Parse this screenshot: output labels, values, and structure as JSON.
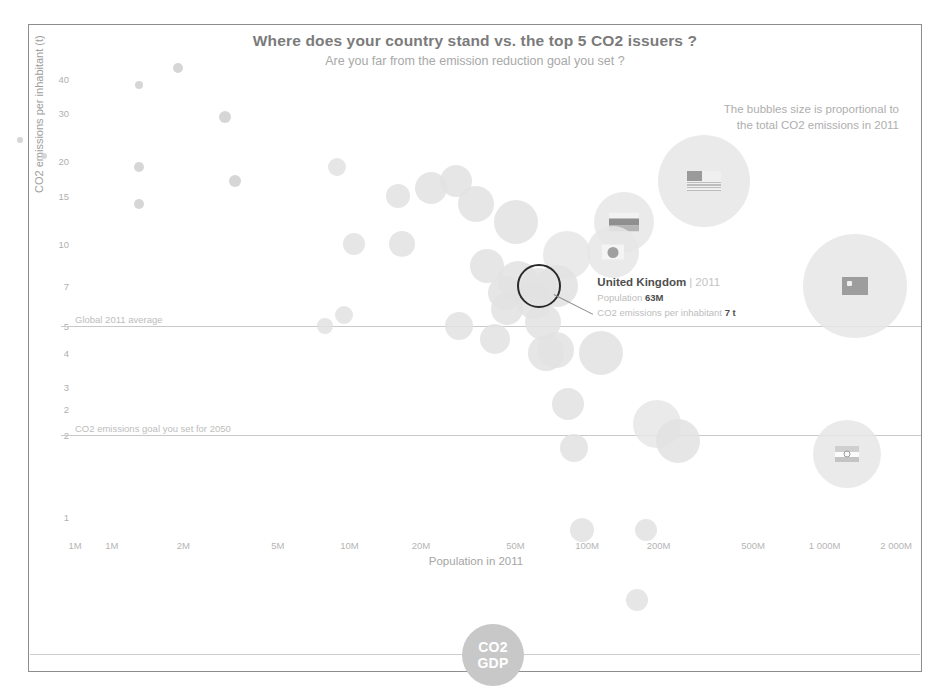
{
  "header": {
    "title": "Where does your country stand vs. the top 5 CO2 issuers ?",
    "subtitle": "Are you far from the emission reduction goal you set ?"
  },
  "legend": {
    "line1": "The bubbles size is proportional to",
    "line2": "the total CO2 emissions in 2011"
  },
  "tooltip": {
    "country": "United Kingdom",
    "separator": "|",
    "year": "2011",
    "population_label": "Population",
    "population_value": "63M",
    "emissions_label": "CO2 emissions per inhabitant",
    "emissions_value": "7 t"
  },
  "reference_lines": [
    {
      "label": "Global 2011 average",
      "value": 5
    },
    {
      "label": "CO2 emissions goal you set for 2050",
      "value": 2
    }
  ],
  "logo": {
    "line1": "CO2",
    "line2": "GDP"
  },
  "colors": {
    "bubble": "#e2e2e2",
    "bubble_dark": "#cfcfcf",
    "highlight": "#2b2b2b",
    "title": "#7b7b7b",
    "axis_text": "#b0b0b0",
    "refline": "#c9c9c9",
    "frame": "#8d8d8d",
    "logo": "#c8c8c8"
  },
  "chart_data": {
    "type": "scatter",
    "title": "Where does your country stand vs. the top 5 CO2 issuers ?",
    "subtitle": "Are you far from the emission reduction goal you set ?",
    "xlabel": "Population in 2011",
    "ylabel": "CO2 emissions per inhabitant (t)",
    "xscale": "log",
    "yscale": "log",
    "xlim": [
      700000,
      2400000000
    ],
    "ylim": [
      0.9,
      45
    ],
    "xticks": [
      "1M",
      "1M",
      "2M",
      "5M",
      "10M",
      "20M",
      "50M",
      "100M",
      "200M",
      "500M",
      "1 000M",
      "2 000M"
    ],
    "xtick_values": [
      700000,
      1000000,
      2000000,
      5000000,
      10000000,
      20000000,
      50000000,
      100000000,
      200000000,
      500000000,
      1000000000,
      2000000000
    ],
    "yticks": [
      "40",
      "30",
      "20",
      "15",
      "10",
      "7",
      "5",
      "4",
      "3",
      "2",
      "2",
      "1"
    ],
    "ytick_values": [
      40,
      30,
      20,
      15,
      10,
      7,
      5,
      4,
      3,
      2.5,
      2,
      1
    ],
    "grid": false,
    "legend_position": "top-right",
    "size_encoding": "total CO2 emissions in 2011",
    "highlighted": "United Kingdom",
    "annotations": [
      "The bubbles size is proportional to the total CO2 emissions in 2011",
      "Global 2011 average",
      "CO2 emissions goal you set for 2050"
    ],
    "points": [
      {
        "name": "Qatar",
        "population": 1900000,
        "emissions_per_capita": 44,
        "size": 5
      },
      {
        "name": "Trinidad",
        "population": 1300000,
        "emissions_per_capita": 38,
        "size": 4
      },
      {
        "name": "Kuwait",
        "population": 3000000,
        "emissions_per_capita": 29,
        "size": 6
      },
      {
        "name": "Brunei",
        "population": 410000,
        "emissions_per_capita": 24,
        "size": 3
      },
      {
        "name": "Luxembourg",
        "population": 520000,
        "emissions_per_capita": 21,
        "size": 3
      },
      {
        "name": "UAE",
        "population": 8900000,
        "emissions_per_capita": 19,
        "size": 9
      },
      {
        "name": "Bahrain",
        "population": 1300000,
        "emissions_per_capita": 19,
        "size": 5
      },
      {
        "name": "Oman",
        "population": 3300000,
        "emissions_per_capita": 17,
        "size": 6
      },
      {
        "name": "Saudi Arabia",
        "population": 28000000,
        "emissions_per_capita": 17,
        "size": 16
      },
      {
        "name": "Australia",
        "population": 22000000,
        "emissions_per_capita": 16,
        "size": 16
      },
      {
        "name": "United States",
        "population": 312000000,
        "emissions_per_capita": 17,
        "size": 46
      },
      {
        "name": "Kazakhstan",
        "population": 16000000,
        "emissions_per_capita": 15,
        "size": 12
      },
      {
        "name": "Canada",
        "population": 34000000,
        "emissions_per_capita": 14,
        "size": 18
      },
      {
        "name": "Estonia",
        "population": 1300000,
        "emissions_per_capita": 14,
        "size": 5
      },
      {
        "name": "Russia",
        "population": 143000000,
        "emissions_per_capita": 12,
        "size": 30
      },
      {
        "name": "South Korea",
        "population": 50000000,
        "emissions_per_capita": 12,
        "size": 22
      },
      {
        "name": "Czech Rep.",
        "population": 10500000,
        "emissions_per_capita": 10,
        "size": 11
      },
      {
        "name": "Netherlands",
        "population": 16700000,
        "emissions_per_capita": 10,
        "size": 13
      },
      {
        "name": "Japan",
        "population": 128000000,
        "emissions_per_capita": 9.3,
        "size": 26
      },
      {
        "name": "Germany",
        "population": 82000000,
        "emissions_per_capita": 9.1,
        "size": 24
      },
      {
        "name": "Poland",
        "population": 38000000,
        "emissions_per_capita": 8.3,
        "size": 17
      },
      {
        "name": "South Africa",
        "population": 51000000,
        "emissions_per_capita": 7.3,
        "size": 20
      },
      {
        "name": "China",
        "population": 1340000000,
        "emissions_per_capita": 7.0,
        "size": 52
      },
      {
        "name": "United Kingdom",
        "population": 63000000,
        "emissions_per_capita": 7.0,
        "size": 18
      },
      {
        "name": "Iran",
        "population": 75000000,
        "emissions_per_capita": 7.0,
        "size": 21
      },
      {
        "name": "Ukraine",
        "population": 45000000,
        "emissions_per_capita": 6.6,
        "size": 17
      },
      {
        "name": "Italy",
        "population": 60000000,
        "emissions_per_capita": 6.2,
        "size": 18
      },
      {
        "name": "Spain",
        "population": 46000000,
        "emissions_per_capita": 5.8,
        "size": 16
      },
      {
        "name": "France",
        "population": 65000000,
        "emissions_per_capita": 5.2,
        "size": 18
      },
      {
        "name": "Malaysia",
        "population": 29000000,
        "emissions_per_capita": 5.0,
        "size": 14
      },
      {
        "name": "Mexico",
        "population": 115000000,
        "emissions_per_capita": 4.0,
        "size": 22
      },
      {
        "name": "Thailand",
        "population": 67000000,
        "emissions_per_capita": 4.0,
        "size": 18
      },
      {
        "name": "Turkey",
        "population": 74000000,
        "emissions_per_capita": 4.1,
        "size": 18
      },
      {
        "name": "Argentina",
        "population": 41000000,
        "emissions_per_capita": 4.5,
        "size": 15
      },
      {
        "name": "Sweden",
        "population": 9500000,
        "emissions_per_capita": 5.5,
        "size": 9
      },
      {
        "name": "Switzerland",
        "population": 7900000,
        "emissions_per_capita": 5.0,
        "size": 8
      },
      {
        "name": "Brazil",
        "population": 197000000,
        "emissions_per_capita": 2.2,
        "size": 24
      },
      {
        "name": "Indonesia",
        "population": 242000000,
        "emissions_per_capita": 1.9,
        "size": 22
      },
      {
        "name": "Egypt",
        "population": 83000000,
        "emissions_per_capita": 2.6,
        "size": 16
      },
      {
        "name": "India",
        "population": 1240000000,
        "emissions_per_capita": 1.7,
        "size": 34
      },
      {
        "name": "Vietnam",
        "population": 88000000,
        "emissions_per_capita": 1.8,
        "size": 14
      },
      {
        "name": "Philippines",
        "population": 95000000,
        "emissions_per_capita": 0.9,
        "size": 12
      },
      {
        "name": "Nigeria",
        "population": 162000000,
        "emissions_per_capita": 0.5,
        "size": 11
      },
      {
        "name": "Pakistan",
        "population": 177000000,
        "emissions_per_capita": 0.9,
        "size": 11
      }
    ]
  }
}
